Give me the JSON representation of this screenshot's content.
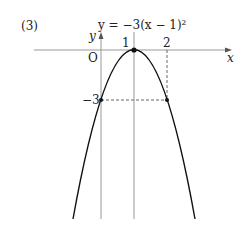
{
  "figure": {
    "problem_number": "(3)",
    "equation": "y = −3(x − 1)²",
    "axis_labels": {
      "x": "x",
      "y": "y",
      "origin": "O"
    },
    "tick_labels": {
      "x1": "1",
      "x2": "2",
      "y_neg3": "−3"
    },
    "function": {
      "a": -3,
      "h": 1,
      "k": 0
    },
    "vertex": [
      1,
      0
    ],
    "marked_points": [
      [
        0,
        -3
      ],
      [
        2,
        -3
      ],
      [
        1,
        0
      ]
    ],
    "colors": {
      "curve": "#111111",
      "axis": "#999999",
      "dashed": "#555555"
    }
  }
}
